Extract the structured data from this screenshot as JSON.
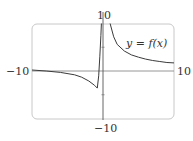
{
  "chart_data": {
    "type": "line",
    "title": "",
    "xlabel": "",
    "ylabel": "",
    "xlim": [
      -10,
      10
    ],
    "ylim": [
      -10,
      10
    ],
    "grid": false,
    "tick_labels": {
      "x_min": "−10",
      "x_max": "10",
      "y_max": "10",
      "y_min": "−10"
    },
    "y_ticks": [
      -5,
      5
    ],
    "annotations": [
      {
        "text": "y = f(x)",
        "x": 5.5,
        "y": 5.8
      }
    ],
    "series": [
      {
        "name": "y = f(x)",
        "branch": "left",
        "points": [
          [
            -10,
            0.2
          ],
          [
            -8,
            0.0
          ],
          [
            -6,
            -0.3
          ],
          [
            -4,
            -0.8
          ],
          [
            -3,
            -1.3
          ],
          [
            -2,
            -2.1
          ],
          [
            -1.2,
            -3.0
          ],
          [
            -0.8,
            -3.6
          ],
          [
            -0.6,
            -1.0
          ],
          [
            -0.45,
            3.0
          ],
          [
            -0.3,
            7.5
          ],
          [
            -0.22,
            10
          ]
        ]
      },
      {
        "name": "y = f(x)",
        "branch": "right",
        "points": [
          [
            1.0,
            10
          ],
          [
            1.5,
            7.2
          ],
          [
            2,
            5.6
          ],
          [
            3,
            4.2
          ],
          [
            4,
            3.4
          ],
          [
            5,
            2.9
          ],
          [
            6,
            2.5
          ],
          [
            7,
            2.2
          ],
          [
            8,
            2.0
          ],
          [
            9,
            1.8
          ],
          [
            10,
            1.7
          ]
        ]
      }
    ],
    "colors": {
      "curve": "#3a3a3a",
      "axes": "#8a8a8a",
      "frame": "#c8c8c8"
    }
  },
  "labels": {
    "x_min": "−10",
    "x_max": "10",
    "y_max": "10",
    "y_min": "−10",
    "function": "y = f(x)"
  }
}
